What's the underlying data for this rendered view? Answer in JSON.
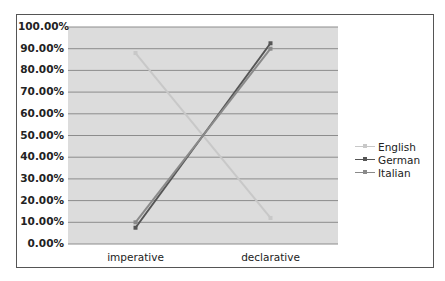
{
  "chart_data": {
    "type": "line",
    "title": "",
    "xlabel": "",
    "ylabel": "",
    "categories": [
      "imperative",
      "declarative"
    ],
    "series": [
      {
        "name": "English",
        "values": [
          88,
          12
        ],
        "color": "#c8c8c8"
      },
      {
        "name": "German",
        "values": [
          7.5,
          92.5
        ],
        "color": "#555555"
      },
      {
        "name": "Italian",
        "values": [
          10,
          90
        ],
        "color": "#8a8a8a"
      }
    ],
    "ylim": [
      0,
      100
    ],
    "yticks": [
      "0.00%",
      "10.00%",
      "20.00%",
      "30.00%",
      "40.00%",
      "50.00%",
      "60.00%",
      "70.00%",
      "80.00%",
      "90.00%",
      "100.00%"
    ],
    "grid": true,
    "legend_position": "right"
  }
}
